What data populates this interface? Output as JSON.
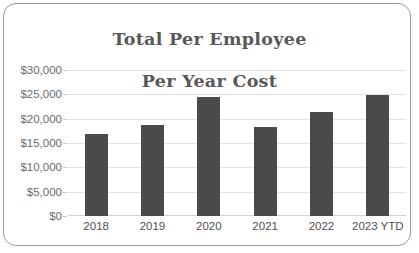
{
  "chart_data": {
    "type": "bar",
    "title": "Total Per Employee\nPer Year Cost",
    "title_line1": "Total Per Employee",
    "title_line2": "Per Year Cost",
    "xlabel": "",
    "ylabel": "",
    "categories": [
      "2018",
      "2019",
      "2020",
      "2021",
      "2022",
      "2023 YTD"
    ],
    "values": [
      16800,
      18700,
      24400,
      18300,
      21400,
      24800
    ],
    "series": [
      {
        "name": "Total Per Employee Per Year Cost",
        "values": [
          16800,
          18700,
          24400,
          18300,
          21400,
          24800
        ]
      }
    ],
    "ylim": [
      0,
      30000
    ],
    "ytick_values": [
      0,
      5000,
      10000,
      15000,
      20000,
      25000,
      30000
    ],
    "ytick_labels": [
      "$0",
      "$5,000",
      "$10,000",
      "$15,000",
      "$20,000",
      "$25,000",
      "$30,000"
    ],
    "grid": true,
    "legend": false,
    "legend_position": "none",
    "bar_color": "#4a4a4a",
    "gridline_color": "#e2e2e2",
    "title_color": "#585858",
    "axis_label_color": "#6b6b6b",
    "frame_color": "#9a9a9a",
    "background_color": "#ffffff"
  }
}
